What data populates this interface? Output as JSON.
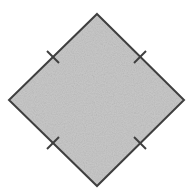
{
  "diagram": {
    "type": "rhombus",
    "vertices": {
      "top": [
        97,
        14
      ],
      "right": [
        184,
        100
      ],
      "bottom": [
        97,
        186
      ],
      "left": [
        9,
        100
      ]
    },
    "fill_color": "#c9c9c9",
    "stroke_color": "#3f3f3f",
    "stroke_width": 2,
    "tick_marks": [
      {
        "side": "top-left",
        "count": 1
      },
      {
        "side": "top-right",
        "count": 1
      },
      {
        "side": "bottom-left",
        "count": 1
      },
      {
        "side": "bottom-right",
        "count": 1
      }
    ],
    "labels": []
  }
}
